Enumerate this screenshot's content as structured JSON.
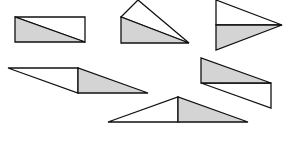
{
  "diagram": {
    "colors": {
      "shaded_fill": "#d4d4d4",
      "blank_fill": "#ffffff",
      "stroke": "#111111",
      "background": "#ffffff"
    },
    "figures": [
      {
        "id": "rectangle",
        "shaded": "15,17 15,42 85,42",
        "blank": "15,17 85,17 85,42"
      },
      {
        "id": "kite-like-quad",
        "shaded": "121,17 121,43 189,43",
        "blank": "121,17 138,0 189,43"
      },
      {
        "id": "arrowhead-triangle",
        "shaded": "216,25 216,50 282,25",
        "blank": "216,0 216,25 282,25"
      },
      {
        "id": "parallelogram-left",
        "shaded": "78,68 78,93 148,93",
        "blank": "8,68 78,68 78,93"
      },
      {
        "id": "parallelogram-right",
        "shaded": "201,58 201,83 271,83",
        "blank": "201,83 271,83 271,108"
      },
      {
        "id": "isosceles-triangle",
        "shaded": "178,97 178,122 248,122",
        "blank": "108,122 178,97 178,122"
      }
    ]
  }
}
